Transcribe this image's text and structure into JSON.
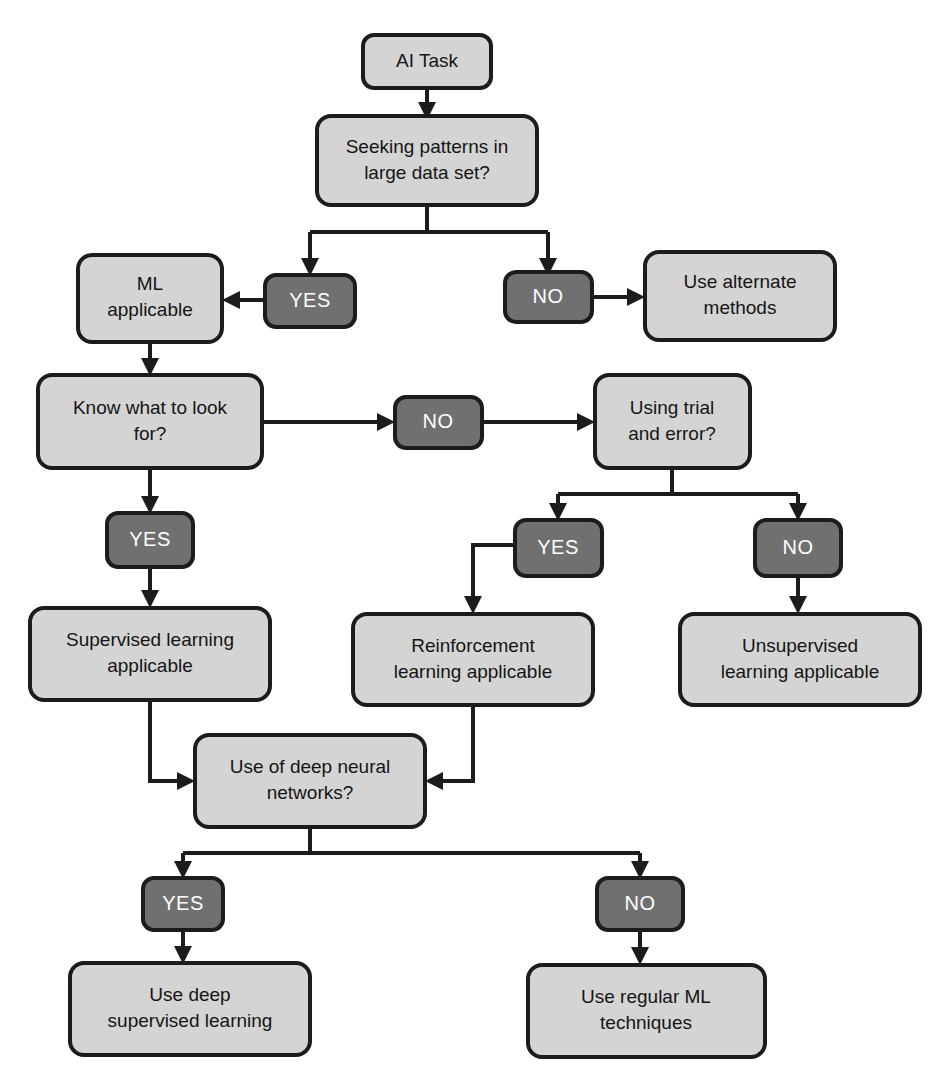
{
  "diagram": {
    "colors": {
      "node_fill": "#d4d4d4",
      "badge_fill": "#707070",
      "stroke": "#1c1c1c",
      "node_text": "#151515",
      "badge_text": "#ffffff",
      "background": "#ffffff"
    }
  },
  "nodes": [
    {
      "id": "ai_task",
      "type": "process",
      "lines": [
        "AI Task"
      ]
    },
    {
      "id": "seeking_patterns",
      "type": "decision",
      "lines": [
        "Seeking patterns in",
        "large data set?"
      ]
    },
    {
      "id": "ml_applicable",
      "type": "process",
      "lines": [
        "ML",
        "applicable"
      ]
    },
    {
      "id": "use_alternate",
      "type": "process",
      "lines": [
        "Use alternate",
        "methods"
      ]
    },
    {
      "id": "know_what",
      "type": "decision",
      "lines": [
        "Know what to look",
        "for?"
      ]
    },
    {
      "id": "using_trial",
      "type": "decision",
      "lines": [
        "Using trial",
        "and error?"
      ]
    },
    {
      "id": "supervised",
      "type": "process",
      "lines": [
        "Supervised learning",
        "applicable"
      ]
    },
    {
      "id": "reinforcement",
      "type": "process",
      "lines": [
        "Reinforcement",
        "learning applicable"
      ]
    },
    {
      "id": "unsupervised",
      "type": "process",
      "lines": [
        "Unsupervised",
        "learning applicable"
      ]
    },
    {
      "id": "deep_nn",
      "type": "decision",
      "lines": [
        "Use of deep neural",
        "networks?"
      ]
    },
    {
      "id": "use_deep_supervised",
      "type": "process",
      "lines": [
        "Use deep",
        "supervised learning"
      ]
    },
    {
      "id": "use_regular_ml",
      "type": "process",
      "lines": [
        "Use regular ML",
        "techniques"
      ]
    }
  ],
  "badges": [
    {
      "id": "yes_patterns",
      "label": "YES"
    },
    {
      "id": "no_patterns",
      "label": "NO"
    },
    {
      "id": "no_know",
      "label": "NO"
    },
    {
      "id": "yes_know",
      "label": "YES"
    },
    {
      "id": "yes_trial",
      "label": "YES"
    },
    {
      "id": "no_trial",
      "label": "NO"
    },
    {
      "id": "yes_deep",
      "label": "YES"
    },
    {
      "id": "no_deep",
      "label": "NO"
    }
  ],
  "edges": [
    {
      "from": "ai_task",
      "to": "seeking_patterns",
      "label": ""
    },
    {
      "from": "seeking_patterns",
      "to": "yes_patterns",
      "label": "YES"
    },
    {
      "from": "yes_patterns",
      "to": "ml_applicable",
      "label": ""
    },
    {
      "from": "seeking_patterns",
      "to": "no_patterns",
      "label": "NO"
    },
    {
      "from": "no_patterns",
      "to": "use_alternate",
      "label": ""
    },
    {
      "from": "ml_applicable",
      "to": "know_what",
      "label": ""
    },
    {
      "from": "know_what",
      "to": "no_know",
      "label": "NO"
    },
    {
      "from": "no_know",
      "to": "using_trial",
      "label": ""
    },
    {
      "from": "know_what",
      "to": "yes_know",
      "label": "YES"
    },
    {
      "from": "yes_know",
      "to": "supervised",
      "label": ""
    },
    {
      "from": "using_trial",
      "to": "yes_trial",
      "label": "YES"
    },
    {
      "from": "yes_trial",
      "to": "reinforcement",
      "label": ""
    },
    {
      "from": "using_trial",
      "to": "no_trial",
      "label": "NO"
    },
    {
      "from": "no_trial",
      "to": "unsupervised",
      "label": ""
    },
    {
      "from": "supervised",
      "to": "deep_nn",
      "label": ""
    },
    {
      "from": "reinforcement",
      "to": "deep_nn",
      "label": ""
    },
    {
      "from": "deep_nn",
      "to": "yes_deep",
      "label": "YES"
    },
    {
      "from": "yes_deep",
      "to": "use_deep_supervised",
      "label": ""
    },
    {
      "from": "deep_nn",
      "to": "no_deep",
      "label": "NO"
    },
    {
      "from": "no_deep",
      "to": "use_regular_ml",
      "label": ""
    }
  ]
}
